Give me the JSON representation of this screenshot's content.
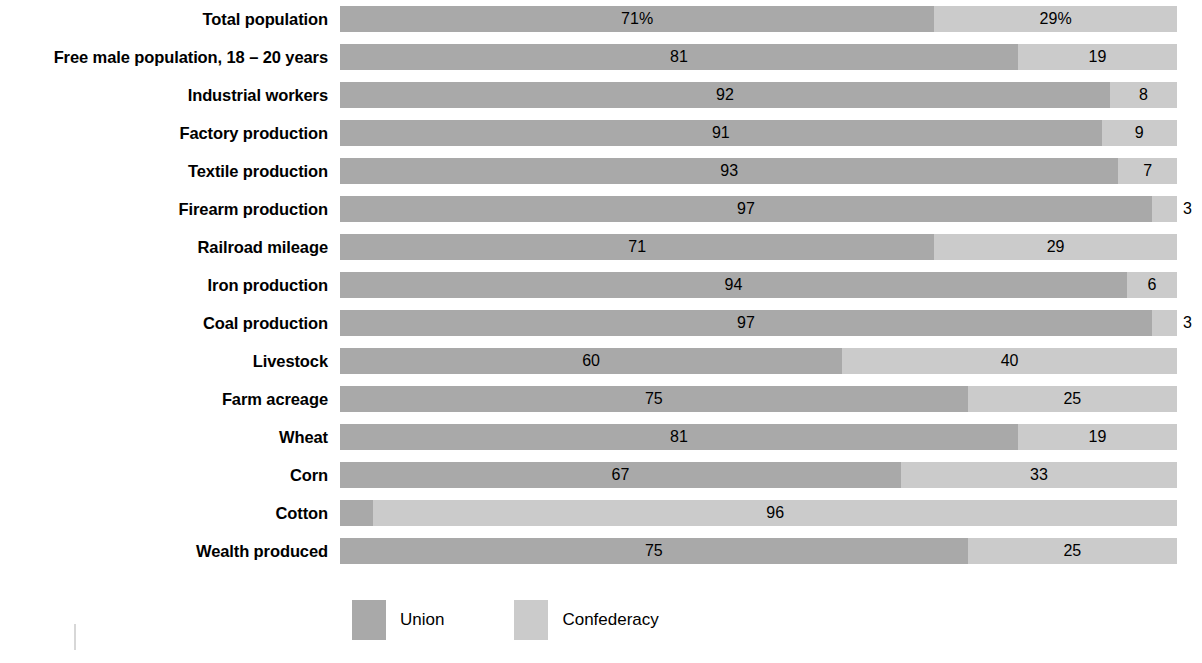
{
  "chart_data": {
    "type": "bar",
    "subtype": "stacked-horizontal-100",
    "title": "",
    "subtitle": "",
    "xlabel": "",
    "ylabel": "",
    "xlim": [
      0,
      100
    ],
    "grid": false,
    "legend_position": "bottom-left",
    "categories": [
      "Total population",
      "Free male population, 18 – 20 years",
      "Industrial workers",
      "Factory production",
      "Textile production",
      "Firearm production",
      "Railroad mileage",
      "Iron production",
      "Coal production",
      "Livestock",
      "Farm acreage",
      "Wheat",
      "Corn",
      "Cotton",
      "Wealth produced"
    ],
    "series": [
      {
        "name": "Union",
        "color": "#a9a9a9",
        "values": [
          71,
          81,
          92,
          91,
          93,
          97,
          71,
          94,
          97,
          60,
          75,
          81,
          67,
          4,
          75
        ]
      },
      {
        "name": "Confederacy",
        "color": "#cbcbcb",
        "values": [
          29,
          19,
          8,
          9,
          7,
          3,
          29,
          6,
          3,
          40,
          25,
          19,
          33,
          96,
          25
        ]
      }
    ],
    "value_labels": [
      {
        "union": "71%",
        "confederacy": "29%"
      },
      {
        "union": "81",
        "confederacy": "19"
      },
      {
        "union": "92",
        "confederacy": "8"
      },
      {
        "union": "91",
        "confederacy": "9"
      },
      {
        "union": "93",
        "confederacy": "7"
      },
      {
        "union": "97",
        "confederacy": "3"
      },
      {
        "union": "71",
        "confederacy": "29"
      },
      {
        "union": "94",
        "confederacy": "6"
      },
      {
        "union": "97",
        "confederacy": "3"
      },
      {
        "union": "60",
        "confederacy": "40"
      },
      {
        "union": "75",
        "confederacy": "25"
      },
      {
        "union": "81",
        "confederacy": "19"
      },
      {
        "union": "67",
        "confederacy": "33"
      },
      {
        "union": "4",
        "confederacy": "96"
      },
      {
        "union": "75",
        "confederacy": "25"
      }
    ]
  },
  "rows": [
    {
      "label": "Total population",
      "union": 71,
      "confederacy": 29,
      "union_label": "71%",
      "confederacy_label": "29%"
    },
    {
      "label": "Free male population, 18 – 20 years",
      "union": 81,
      "confederacy": 19,
      "union_label": "81",
      "confederacy_label": "19"
    },
    {
      "label": "Industrial workers",
      "union": 92,
      "confederacy": 8,
      "union_label": "92",
      "confederacy_label": "8"
    },
    {
      "label": "Factory production",
      "union": 91,
      "confederacy": 9,
      "union_label": "91",
      "confederacy_label": "9"
    },
    {
      "label": "Textile production",
      "union": 93,
      "confederacy": 7,
      "union_label": "93",
      "confederacy_label": "7"
    },
    {
      "label": "Firearm production",
      "union": 97,
      "confederacy": 3,
      "union_label": "97",
      "confederacy_label": "3"
    },
    {
      "label": "Railroad mileage",
      "union": 71,
      "confederacy": 29,
      "union_label": "71",
      "confederacy_label": "29"
    },
    {
      "label": "Iron production",
      "union": 94,
      "confederacy": 6,
      "union_label": "94",
      "confederacy_label": "6"
    },
    {
      "label": "Coal production",
      "union": 97,
      "confederacy": 3,
      "union_label": "97",
      "confederacy_label": "3"
    },
    {
      "label": "Livestock",
      "union": 60,
      "confederacy": 40,
      "union_label": "60",
      "confederacy_label": "40"
    },
    {
      "label": "Farm acreage",
      "union": 75,
      "confederacy": 25,
      "union_label": "75",
      "confederacy_label": "25"
    },
    {
      "label": "Wheat",
      "union": 81,
      "confederacy": 19,
      "union_label": "81",
      "confederacy_label": "19"
    },
    {
      "label": "Corn",
      "union": 67,
      "confederacy": 33,
      "union_label": "67",
      "confederacy_label": "33"
    },
    {
      "label": "Cotton",
      "union": 4,
      "confederacy": 96,
      "union_label": "4",
      "confederacy_label": "96"
    },
    {
      "label": "Wealth produced",
      "union": 75,
      "confederacy": 25,
      "union_label": "75",
      "confederacy_label": "25"
    }
  ],
  "legend": {
    "items": [
      {
        "label": "Union",
        "color": "#a9a9a9"
      },
      {
        "label": "Confederacy",
        "color": "#cbcbcb"
      }
    ]
  },
  "colors": {
    "union": "#a9a9a9",
    "confederacy": "#cbcbcb",
    "background": "#ffffff",
    "text": "#000000"
  }
}
